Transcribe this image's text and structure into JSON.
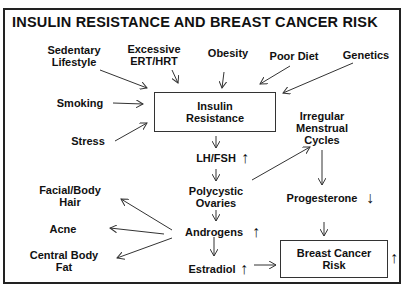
{
  "title": "INSULIN RESISTANCE AND BREAST CANCER RISK",
  "risk_factors": {
    "sedentary": "Sedentary\nLifestyle",
    "ert": "Excessive\nERT/HRT",
    "obesity": "Obesity",
    "poor_diet": "Poor Diet",
    "genetics": "Genetics",
    "smoking": "Smoking",
    "stress": "Stress"
  },
  "nodes": {
    "insulin_resistance": "Insulin\nResistance",
    "lh_fsh": "LH/FSH",
    "polycystic_ovaries": "Polycystic\nOvaries",
    "androgens": "Androgens",
    "estradiol": "Estradiol",
    "irregular_cycles": "Irregular\nMenstrual\nCycles",
    "progesterone": "Progesterone",
    "breast_cancer_risk": "Breast Cancer\nRisk",
    "facial_hair": "Facial/Body\nHair",
    "acne": "Acne",
    "central_fat": "Central Body\nFat"
  },
  "indicators": {
    "lh_fsh": "↑",
    "androgens": "↑",
    "estradiol": "↑",
    "progesterone": "↓",
    "breast_cancer_risk": "↑"
  }
}
